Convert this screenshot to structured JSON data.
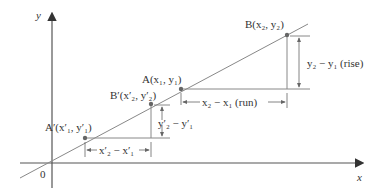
{
  "diagram": {
    "axes": {
      "x_label": "x",
      "y_label": "y",
      "origin_label": "0"
    },
    "points": {
      "A_prime": {
        "label": "A′(x′₁, y′₁)"
      },
      "B_prime": {
        "label": "B′(x′₂, y′₂)"
      },
      "A": {
        "label": "A(x₁, y₁)"
      },
      "B": {
        "label": "B(x₂, y₂)"
      }
    },
    "annotations": {
      "rise": "y₂ − y₁ (rise)",
      "run": "x₂ − x₁ (run)",
      "rise_prime": "y′₂ − y′₁",
      "run_prime": "x′₂ − x′₁"
    },
    "colors": {
      "line": "#888888",
      "point": "#666666",
      "text": "#333333",
      "axis": "#555555"
    }
  }
}
